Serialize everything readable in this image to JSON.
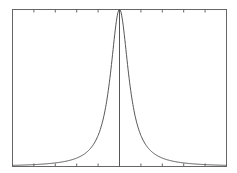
{
  "chart_data": {
    "type": "line",
    "title": "",
    "xlabel": "",
    "ylabel": "",
    "grid": false,
    "legend": null,
    "xlim": [
      -5,
      5
    ],
    "ylim": [
      0,
      1
    ],
    "x_ticks": [
      -4,
      -3,
      -2,
      -1,
      0,
      1,
      2,
      3,
      4
    ],
    "center_line_x": 0,
    "series": [
      {
        "name": "peak",
        "x": [
          -5,
          -4,
          -3,
          -2,
          -1.5,
          -1,
          -0.75,
          -0.5,
          -0.25,
          0,
          0.25,
          0.5,
          0.75,
          1,
          1.5,
          2,
          3,
          4,
          5
        ],
        "values": [
          0.005,
          0.01,
          0.02,
          0.05,
          0.09,
          0.18,
          0.27,
          0.42,
          0.68,
          1.0,
          0.68,
          0.42,
          0.27,
          0.18,
          0.09,
          0.05,
          0.02,
          0.01,
          0.005
        ]
      }
    ],
    "colors": {
      "line": "#555555",
      "axes": "#666666",
      "background": "#ffffff"
    }
  }
}
